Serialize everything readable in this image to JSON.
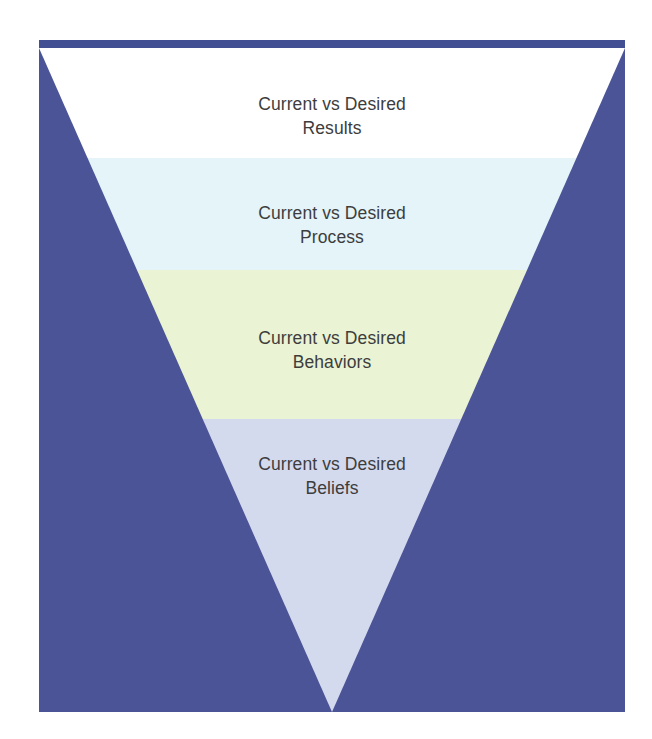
{
  "figure": {
    "type": "inverted-pyramid-funnel",
    "background_color": "#ffffff",
    "panel_color": "#4a5496",
    "panel_top_bar_color": "#434f93",
    "text_color": "#3d3d3d"
  },
  "bands": [
    {
      "id": "results",
      "line1": "Current vs Desired",
      "line2": "Results",
      "fill": "#ffffff",
      "top_pct": 0.0,
      "height_pct": 16.6
    },
    {
      "id": "process",
      "line1": "Current vs Desired",
      "line2": "Process",
      "fill": "#e4f4f9",
      "top_pct": 16.6,
      "height_pct": 16.9
    },
    {
      "id": "behaviors",
      "line1": "Current vs Desired",
      "line2": "Behaviors",
      "fill": "#eaf3d3",
      "top_pct": 33.5,
      "height_pct": 22.4
    },
    {
      "id": "beliefs",
      "line1": "Current vs Desired",
      "line2": "Beliefs",
      "fill": "#d4daee",
      "top_pct": 55.9,
      "height_pct": 44.1
    }
  ],
  "labels": [
    {
      "id": "results",
      "line1": "Current vs Desired",
      "line2": "Results",
      "top_pct": 6.6
    },
    {
      "id": "process",
      "line1": "Current vs Desired",
      "line2": "Process",
      "top_pct": 23.0
    },
    {
      "id": "behaviors",
      "line1": "Current vs Desired",
      "line2": "Behaviors",
      "top_pct": 41.9
    },
    {
      "id": "beliefs",
      "line1": "Current vs Desired",
      "line2": "Beliefs",
      "top_pct": 60.8
    }
  ]
}
